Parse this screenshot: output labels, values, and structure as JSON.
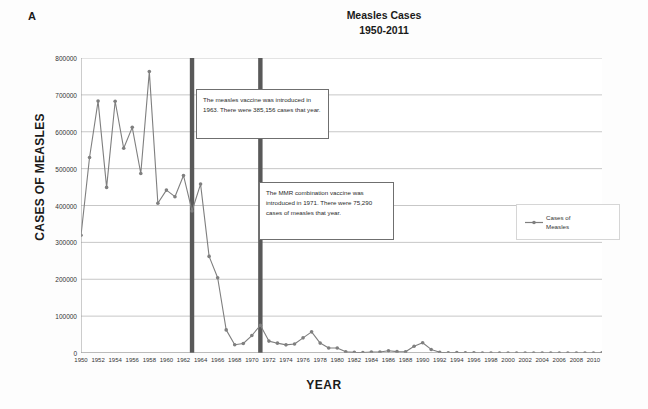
{
  "panel_letter": "A",
  "title": {
    "line1": "Measles Cases",
    "line2": "1950-2011"
  },
  "axes": {
    "xlabel": "YEAR",
    "ylabel": "CASES OF MEASLES"
  },
  "legend": {
    "position": "right",
    "entries": [
      {
        "label_line1": "Cases of",
        "label_line2": "Measles",
        "color": "#7f7f7f"
      }
    ]
  },
  "annotations": [
    {
      "name": "measles-vaccine-1963",
      "year": 1963,
      "text": "The measles vaccine was introduced in 1963.  There were 385,156  cases that year."
    },
    {
      "name": "mmr-vaccine-1971",
      "year": 1971,
      "text": "The MMR  combination vaccine was introduced in 1971. There were 75,290  cases of measles that year."
    }
  ],
  "markers": [
    {
      "name": "vline-1963",
      "year": 1963,
      "color": "#595959"
    },
    {
      "name": "vline-1971",
      "year": 1971,
      "color": "#595959"
    }
  ],
  "chart_data": {
    "type": "line",
    "title": "Measles Cases 1950-2011",
    "xlabel": "YEAR",
    "ylabel": "CASES OF MEASLES",
    "xlim": [
      1950,
      2011
    ],
    "ylim": [
      0,
      800000
    ],
    "ytick_step": 100000,
    "yticks": [
      0,
      100000,
      200000,
      300000,
      400000,
      500000,
      600000,
      700000,
      800000
    ],
    "ytick_labels": [
      "0",
      "100000",
      "200000",
      "300000",
      "400000",
      "500000",
      "600000",
      "700000",
      "800000"
    ],
    "xticks": [
      1950,
      1952,
      1954,
      1956,
      1958,
      1960,
      1962,
      1964,
      1966,
      1968,
      1970,
      1972,
      1974,
      1976,
      1978,
      1980,
      1982,
      1984,
      1986,
      1988,
      1990,
      1992,
      1994,
      1996,
      1998,
      2000,
      2002,
      2004,
      2006,
      2008,
      2010
    ],
    "grid": "horizontal",
    "marker": "filled-circle",
    "x": [
      1950,
      1951,
      1952,
      1953,
      1954,
      1955,
      1956,
      1957,
      1958,
      1959,
      1960,
      1961,
      1962,
      1963,
      1964,
      1965,
      1966,
      1967,
      1968,
      1969,
      1970,
      1971,
      1972,
      1973,
      1974,
      1975,
      1976,
      1977,
      1978,
      1979,
      1980,
      1981,
      1982,
      1983,
      1984,
      1985,
      1986,
      1987,
      1988,
      1989,
      1990,
      1991,
      1992,
      1993,
      1994,
      1995,
      1996,
      1997,
      1998,
      1999,
      2000,
      2001,
      2002,
      2003,
      2004,
      2005,
      2006,
      2007,
      2008,
      2009,
      2010,
      2011
    ],
    "series": [
      {
        "name": "Cases of Measles",
        "color": "#7f7f7f",
        "values": [
          319124,
          530118,
          683077,
          449146,
          682720,
          555156,
          611936,
          486799,
          763094,
          406162,
          441703,
          423919,
          481530,
          385156,
          458083,
          261904,
          204136,
          62705,
          22231,
          25826,
          47351,
          75290,
          32275,
          26690,
          22094,
          24374,
          41126,
          57345,
          26871,
          13597,
          13506,
          3124,
          1714,
          1497,
          2587,
          2822,
          6282,
          3655,
          3396,
          18193,
          27786,
          9643,
          2237,
          312,
          963,
          309,
          508,
          138,
          100,
          100,
          86,
          116,
          44,
          56,
          37,
          66,
          55,
          43,
          140,
          71,
          63,
          222
        ]
      }
    ]
  }
}
